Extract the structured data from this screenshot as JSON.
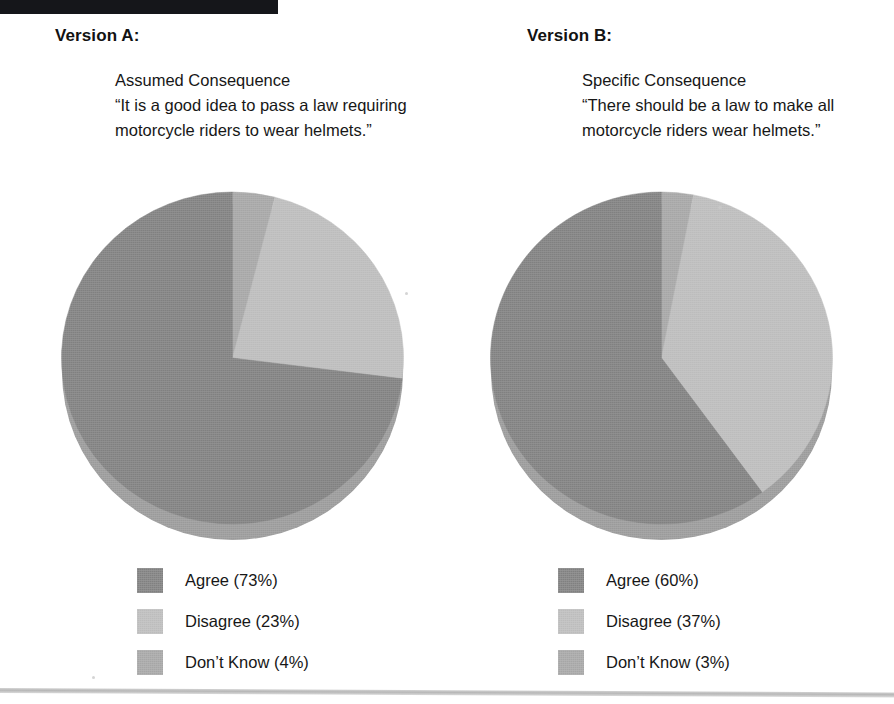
{
  "figure": {
    "background_color": "#ffffff",
    "top_bar_color": "#15161a",
    "bottom_rule_color": "#b4b4b4"
  },
  "colors": {
    "agree": "#808080",
    "disagree": "#bcbcbc",
    "dont_know": "#a6a6a6",
    "pie_depth": "#9a9a9a",
    "text": "#171717"
  },
  "panels": [
    {
      "id": "version-a",
      "heading": "Version A:",
      "question_label": "Assumed Consequence",
      "question_text": "“It is a good idea to pass a law requiring motorcycle riders to wear helmets.”",
      "legend": [
        {
          "label": "Agree (73%)",
          "color": "#808080"
        },
        {
          "label": "Disagree (23%)",
          "color": "#bcbcbc"
        },
        {
          "label": "Don’t Know (4%)",
          "color": "#a6a6a6"
        }
      ]
    },
    {
      "id": "version-b",
      "heading": "Version B:",
      "question_label": "Specific Consequence",
      "question_text": "“There should be a law to make all motorcycle riders wear helmets.”",
      "legend": [
        {
          "label": "Agree (60%)",
          "color": "#808080"
        },
        {
          "label": "Disagree (37%)",
          "color": "#bcbcbc"
        },
        {
          "label": "Don’t Know (3%)",
          "color": "#a6a6a6"
        }
      ]
    }
  ],
  "chart_data": [
    {
      "type": "pie",
      "title": "Version A — Assumed Consequence",
      "subtitle": "“It is a good idea to pass a law requiring motorcycle riders to wear helmets.”",
      "labels": [
        "Don’t Know",
        "Disagree",
        "Agree"
      ],
      "values": [
        4,
        23,
        73
      ],
      "unit": "percent",
      "colors": [
        "#a6a6a6",
        "#bcbcbc",
        "#808080"
      ],
      "start_angle_deg": 0,
      "direction": "clockwise",
      "legend_position": "bottom",
      "legend_order": [
        "Agree (73%)",
        "Disagree (23%)",
        "Don’t Know (4%)"
      ],
      "grid": false
    },
    {
      "type": "pie",
      "title": "Version B — Specific Consequence",
      "subtitle": "“There should be a law to make all motorcycle riders wear helmets.”",
      "labels": [
        "Don’t Know",
        "Disagree",
        "Agree"
      ],
      "values": [
        3,
        37,
        60
      ],
      "unit": "percent",
      "colors": [
        "#a6a6a6",
        "#bcbcbc",
        "#808080"
      ],
      "start_angle_deg": 0,
      "direction": "clockwise",
      "legend_position": "bottom",
      "legend_order": [
        "Agree (60%)",
        "Disagree (37%)",
        "Don’t Know (3%)"
      ],
      "grid": false
    }
  ]
}
